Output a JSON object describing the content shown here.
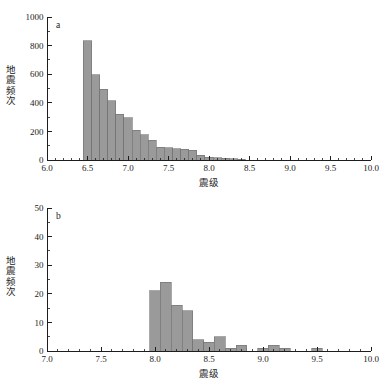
{
  "figure": {
    "background_color": "#ffffff",
    "bar_fill_color": "#9a9a9a",
    "bar_edge_color": "#6f6f6f",
    "axis_color": "#1d1d1d"
  },
  "chart_data": [
    {
      "type": "bar",
      "panel_label": "a",
      "title": "",
      "subtitle": "",
      "xlabel": "震级",
      "ylabel": "地震频次",
      "xlim": [
        6.0,
        10.0
      ],
      "ylim": [
        0,
        1000
      ],
      "xticks": [
        6.0,
        6.5,
        7.0,
        7.5,
        8.0,
        8.5,
        9.0,
        9.5,
        10.0
      ],
      "xtick_labels": [
        "6.0",
        "6.5",
        "7.0",
        "7.5",
        "8.0",
        "8.5",
        "9.0",
        "9.5",
        "10.0"
      ],
      "yticks": [
        0,
        200,
        400,
        600,
        800,
        1000
      ],
      "ytick_labels": [
        "0",
        "200",
        "400",
        "600",
        "800",
        "1000"
      ],
      "xtick_minor_step": 0.1,
      "ytick_minor_step": 100,
      "grid": false,
      "legend": null,
      "bin_width": 0.1,
      "bin_starts": [
        6.45,
        6.55,
        6.65,
        6.75,
        6.85,
        6.95,
        7.05,
        7.15,
        7.25,
        7.35,
        7.45,
        7.55,
        7.65,
        7.75,
        7.85,
        7.95,
        8.05,
        8.15,
        8.25,
        8.35
      ],
      "categories": [
        "6.5",
        "6.6",
        "6.7",
        "6.8",
        "6.9",
        "7.0",
        "7.1",
        "7.2",
        "7.3",
        "7.4",
        "7.5",
        "7.6",
        "7.7",
        "7.8",
        "7.9",
        "8.0",
        "8.1",
        "8.2",
        "8.3",
        "8.4"
      ],
      "values": [
        835,
        595,
        495,
        415,
        320,
        297,
        208,
        178,
        138,
        88,
        85,
        80,
        75,
        67,
        32,
        20,
        16,
        14,
        10,
        4
      ]
    },
    {
      "type": "bar",
      "panel_label": "b",
      "title": "",
      "subtitle": "",
      "xlabel": "震级",
      "ylabel": "地震频次",
      "xlim": [
        7.0,
        10.0
      ],
      "ylim": [
        0,
        50
      ],
      "xticks": [
        7.0,
        7.5,
        8.0,
        8.5,
        9.0,
        9.5,
        10.0
      ],
      "xtick_labels": [
        "7.0",
        "7.5",
        "8.0",
        "8.5",
        "9.0",
        "9.5",
        "10.0"
      ],
      "yticks": [
        0,
        10,
        20,
        30,
        40,
        50
      ],
      "ytick_labels": [
        "0",
        "10",
        "20",
        "30",
        "40",
        "50"
      ],
      "xtick_minor_step": 0.1,
      "ytick_minor_step": 5,
      "grid": false,
      "legend": null,
      "bin_width": 0.1,
      "bin_starts": [
        7.95,
        8.05,
        8.15,
        8.25,
        8.35,
        8.45,
        8.55,
        8.65,
        8.75,
        8.95,
        9.05,
        9.15,
        9.45
      ],
      "categories": [
        "8.0",
        "8.1",
        "8.2",
        "8.3",
        "8.4",
        "8.5",
        "8.6",
        "8.7",
        "8.8",
        "9.0",
        "9.1",
        "9.2",
        "9.5"
      ],
      "values": [
        21,
        24,
        16,
        14,
        4,
        3,
        5,
        1,
        2,
        1,
        2,
        1,
        1
      ]
    }
  ]
}
